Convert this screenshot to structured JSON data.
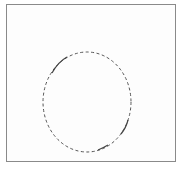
{
  "canvas": {
    "width": 183,
    "height": 169,
    "background": "#ffffff",
    "frame": {
      "x": 6,
      "y": 4,
      "width": 170,
      "height": 158,
      "stroke": "#8a8a8a"
    }
  },
  "shapes": [
    {
      "type": "ellipse",
      "name": "dashed-ellipse",
      "cx": 87,
      "cy": 102,
      "rx": 44,
      "ry": 50,
      "stroke": "#555555",
      "stroke_width": 1,
      "dash": "3 2.5"
    }
  ]
}
